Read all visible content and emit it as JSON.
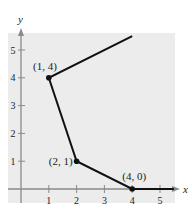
{
  "chart_data": {
    "type": "line",
    "title": "",
    "xlabel": "x",
    "ylabel": "y",
    "xlim": [
      -0.5,
      5.6
    ],
    "ylim": [
      -0.5,
      5.7
    ],
    "x_ticks": [
      "1",
      "2",
      "3",
      "4",
      "5"
    ],
    "y_ticks": [
      "1",
      "2",
      "3",
      "4",
      "5"
    ],
    "grid": false,
    "background": "#ececec",
    "line_color": "#111111",
    "series": [
      {
        "name": "piecewise",
        "x": [
          4.0,
          1,
          2,
          4,
          5.5
        ],
        "y": [
          5.5,
          4,
          1,
          0,
          0
        ]
      }
    ],
    "points": [
      {
        "x": 1,
        "y": 4,
        "label": "(1, 4)"
      },
      {
        "x": 2,
        "y": 1,
        "label": "(2, 1)"
      },
      {
        "x": 4,
        "y": 0,
        "label": "(4, 0)"
      }
    ]
  }
}
